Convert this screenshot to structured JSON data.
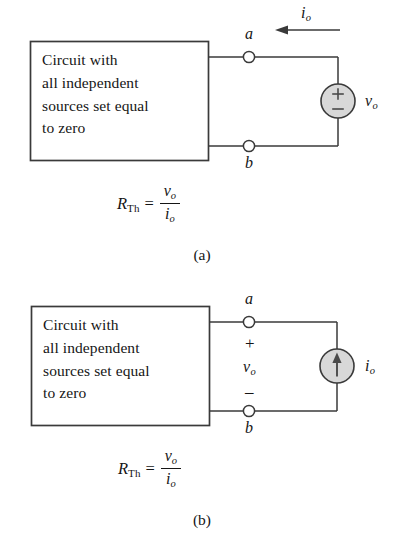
{
  "figure": {
    "type": "circuit-diagram",
    "background_color": "#ffffff",
    "line_color": "#3a3a3a",
    "source_fill_color": "#d8d8d8"
  },
  "panel_a": {
    "caption": "(a)",
    "box_text_lines": [
      "Circuit with",
      "all independent",
      "sources set equal",
      "to zero"
    ],
    "terminal_top": "a",
    "terminal_bottom": "b",
    "current_label": {
      "symbol": "i",
      "subscript": "o"
    },
    "current_arrow_direction": "left",
    "source": {
      "kind": "voltage-source",
      "plus_sign": "+",
      "minus_sign": "–",
      "label": {
        "symbol": "v",
        "subscript": "o"
      }
    },
    "equation": {
      "lhs_symbol": "R",
      "lhs_subscript": "Th",
      "relation": "=",
      "numerator_symbol": "v",
      "numerator_subscript": "o",
      "denominator_symbol": "i",
      "denominator_subscript": "o"
    }
  },
  "panel_b": {
    "caption": "(b)",
    "box_text_lines": [
      "Circuit with",
      "all independent",
      "sources set equal",
      "to zero"
    ],
    "terminal_top": "a",
    "terminal_bottom": "b",
    "polarity_plus": "+",
    "polarity_minus": "–",
    "voltage_label": {
      "symbol": "v",
      "subscript": "o"
    },
    "source": {
      "kind": "current-source",
      "arrow_direction": "up",
      "label": {
        "symbol": "i",
        "subscript": "o"
      }
    },
    "equation": {
      "lhs_symbol": "R",
      "lhs_subscript": "Th",
      "relation": "=",
      "numerator_symbol": "v",
      "numerator_subscript": "o",
      "denominator_symbol": "i",
      "denominator_subscript": "o"
    }
  }
}
